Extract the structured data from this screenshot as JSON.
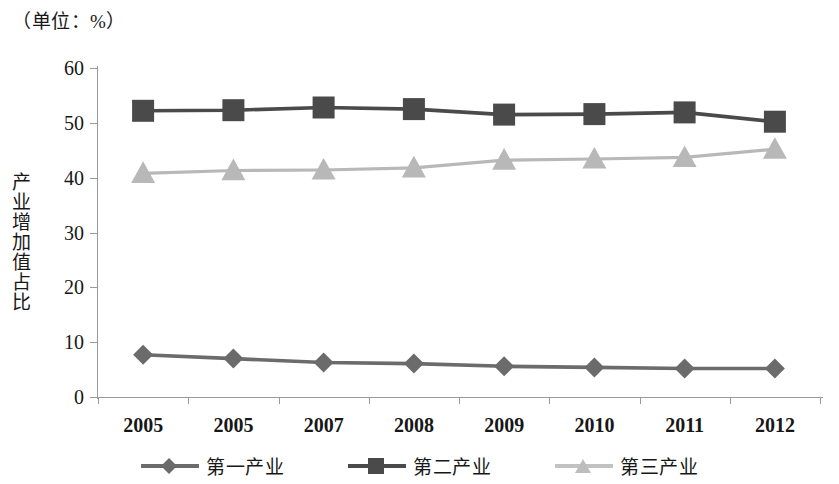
{
  "chart_data": {
    "type": "line",
    "title": "（单位：%）",
    "xlabel": "",
    "ylabel": "产业增加值占比",
    "unit_note": "（单位：%）",
    "categories": [
      "2005",
      "2005",
      "2007",
      "2008",
      "2009",
      "2010",
      "2011",
      "2012"
    ],
    "ylim": [
      0,
      60
    ],
    "yticks": [
      0,
      10,
      20,
      30,
      40,
      50,
      60
    ],
    "grid": false,
    "legend_position": "bottom",
    "series": [
      {
        "name": "第一产业",
        "marker": "diamond",
        "color": "#6b6b6b",
        "values": [
          7.7,
          7.0,
          6.3,
          6.1,
          5.6,
          5.4,
          5.2,
          5.2
        ]
      },
      {
        "name": "第二产业",
        "marker": "square",
        "color": "#4a4a4a",
        "values": [
          52.2,
          52.3,
          52.8,
          52.5,
          51.5,
          51.6,
          51.9,
          50.2
        ]
      },
      {
        "name": "第三产业",
        "marker": "triangle",
        "color": "#b8b8b8",
        "values": [
          40.8,
          41.3,
          41.4,
          41.8,
          43.2,
          43.4,
          43.7,
          45.2
        ]
      }
    ]
  },
  "axis": {
    "y_labels": [
      "60",
      "50",
      "40",
      "30",
      "20",
      "10",
      "0"
    ],
    "x_labels": [
      "2005",
      "2005",
      "2007",
      "2008",
      "2009",
      "2010",
      "2011",
      "2012"
    ]
  },
  "legend": {
    "items": [
      {
        "label": "第一产业"
      },
      {
        "label": "第二产业"
      },
      {
        "label": "第三产业"
      }
    ]
  }
}
